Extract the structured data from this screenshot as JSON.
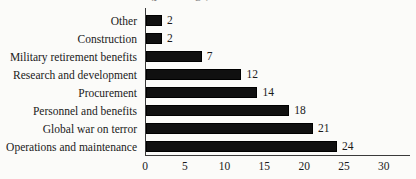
{
  "chart_data": {
    "type": "bar",
    "orientation": "horizontal",
    "title": "(percentage)",
    "xlabel": "",
    "ylabel": "",
    "xlim": [
      0,
      30
    ],
    "grid": false,
    "legend": null,
    "xticks": [
      "0",
      "5",
      "10",
      "15",
      "20",
      "25",
      "30"
    ],
    "xtick_values": [
      0,
      5,
      10,
      15,
      20,
      25,
      30
    ],
    "categories": [
      "Other",
      "Construction",
      "Military retirement benefits",
      "Research and development",
      "Procurement",
      "Personnel and benefits",
      "Global war on terror",
      "Operations and maintenance"
    ],
    "values": [
      2,
      2,
      7,
      12,
      14,
      18,
      21,
      24
    ],
    "value_labels": [
      "2",
      "2",
      "7",
      "12",
      "14",
      "18",
      "21",
      "24"
    ],
    "bar_color": "#101010",
    "axis_color": "#3a3a3a",
    "background_color": "#fbfbf9"
  }
}
